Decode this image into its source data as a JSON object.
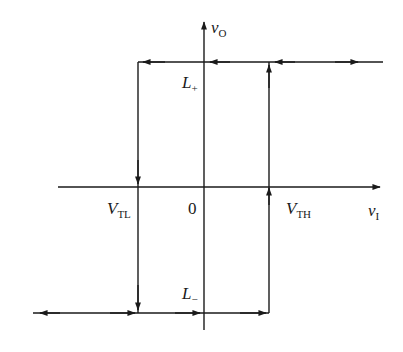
{
  "diagram": {
    "type": "hysteresis transfer characteristic",
    "axes": {
      "y_axis": {
        "label": "v",
        "label_sub": "O"
      },
      "x_axis": {
        "label": "v",
        "label_sub": "I"
      },
      "origin": "0"
    },
    "levels": {
      "upper": {
        "label": "L",
        "label_sub": "+"
      },
      "lower": {
        "label": "L",
        "label_sub": "−"
      }
    },
    "thresholds": {
      "low": {
        "label": "V",
        "label_sub": "TL"
      },
      "high": {
        "label": "V",
        "label_sub": "TH"
      }
    },
    "colors": {
      "line": "#1a1a1a",
      "background": "#ffffff"
    }
  }
}
